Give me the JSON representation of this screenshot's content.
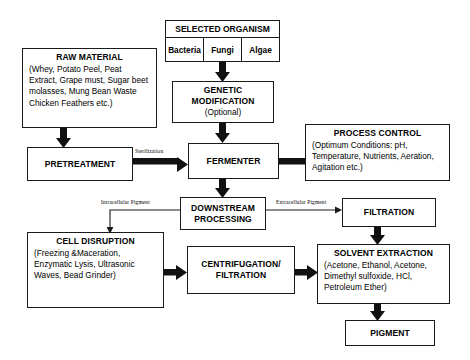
{
  "diagram": {
    "nodes": {
      "selected_organism": {
        "title": "SELECTED ORGANISM",
        "cells": [
          "Bacteria",
          "Fungi",
          "Algae"
        ]
      },
      "raw_material": {
        "title": "RAW MATERIAL",
        "body": "(Whey, Potato Peel, Peat Extract, Grape must, Sugar beet molasses, Mung Bean Waste Chicken Feathers etc.)"
      },
      "genetic_modification": {
        "title_line1": "GENETIC",
        "title_line2": "MODIFICATION",
        "subtitle": "(Optional)"
      },
      "process_control": {
        "title": "PROCESS CONTROL",
        "body": "(Optimum Conditions: pH, Temperature, Nutrients, Aeration, Agitation etc.)"
      },
      "pretreatment": {
        "title": "PRETREATMENT"
      },
      "fermenter": {
        "title": "FERMENTER"
      },
      "downstream_processing": {
        "title_line1": "DOWNSTREAM",
        "title_line2": "PROCESSING"
      },
      "filtration": {
        "title": "FILTRATION"
      },
      "cell_disruption": {
        "title": "CELL DISRUPTION",
        "body": "(Freezing &Maceration, Enzymatic Lysis, Ultrasonic Waves, Bead Grinder)"
      },
      "centrifugation_filtration": {
        "title_line1": "CENTRIFUGATION/",
        "title_line2": "FILTRATION"
      },
      "solvent_extraction": {
        "title": "SOLVENT EXTRACTION",
        "body": "(Acetone, Ethanol, Acetone, Dimethyl sulfoxide, HCl, Petroleum Ether)"
      },
      "pigment": {
        "title": "PIGMENT"
      }
    },
    "edge_labels": {
      "sterilization": "Sterilization",
      "intracellular_pigment": "Intracellular  Pigment",
      "extracellular_pigment": "Extracellular  Pigment"
    },
    "colors": {
      "stroke": "#1a1a1a",
      "arrow": "#111111",
      "background": "#ffffff"
    }
  }
}
